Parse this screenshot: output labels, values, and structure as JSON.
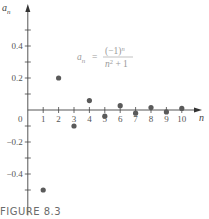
{
  "chart_data": {
    "type": "scatter",
    "title": "",
    "formula": {
      "lhs": "a",
      "lhs_sub": "n",
      "equals": "=",
      "numerator": "(−1)",
      "numerator_sup": "n",
      "denominator": "n",
      "denominator_sup": "2",
      "denominator_rest": " + 1"
    },
    "xlabel": "n",
    "ylabel": "a",
    "ylabel_sub": "n",
    "x": [
      1,
      2,
      3,
      4,
      5,
      6,
      7,
      8,
      9,
      10
    ],
    "values": [
      -0.5,
      0.2,
      -0.1,
      0.0588,
      -0.0385,
      0.027,
      -0.02,
      0.0154,
      -0.0122,
      0.0099
    ],
    "x_ticks": [
      1,
      2,
      3,
      4,
      5,
      6,
      7,
      8,
      9,
      10
    ],
    "x_tick_labels": [
      "1",
      "2",
      "3",
      "4",
      "5",
      "6",
      "7",
      "8",
      "9",
      "10"
    ],
    "y_ticks": [
      -0.5,
      -0.4,
      -0.3,
      -0.2,
      -0.1,
      0.1,
      0.2,
      0.3,
      0.4,
      0.5
    ],
    "y_tick_labels": [
      {
        "value": 0.4,
        "label": "0.4"
      },
      {
        "value": 0.2,
        "label": "0.2"
      },
      {
        "value": -0.2,
        "label": "−0.2"
      },
      {
        "value": -0.4,
        "label": "−0.4"
      }
    ],
    "origin_label": "0",
    "xlim": [
      0,
      11
    ],
    "ylim": [
      -0.59,
      0.62
    ],
    "grid": false,
    "legend": null,
    "colors": {
      "points": "#5a5a5a",
      "axes": "#444444",
      "formula": "#9a9a9a"
    }
  },
  "caption": "FIGURE 8.3"
}
